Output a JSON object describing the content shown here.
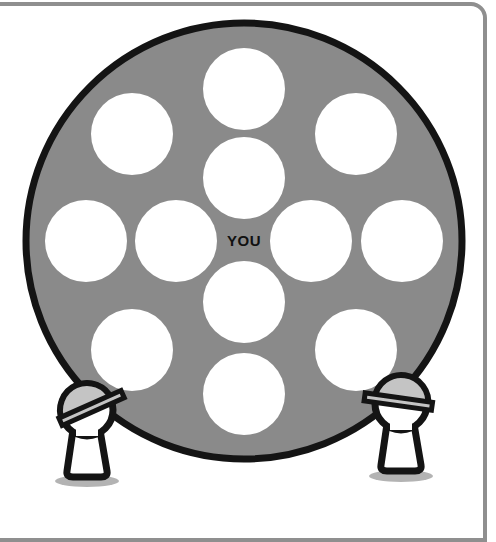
{
  "diagram": {
    "title": "",
    "center_label": "YOU",
    "colors": {
      "background": "#ffffff",
      "frame": "#8f8f8f",
      "disc_fill": "#8a8a8a",
      "disc_border": "#141414",
      "seat_fill": "#ffffff",
      "helmet_fill": "#c4c4c4",
      "figure_outline": "#141414",
      "shadow": "#b3b3b3"
    },
    "disc": {
      "cx": 244,
      "cy": 241,
      "r": 218,
      "border": 7
    },
    "seats": [
      {
        "id": "top",
        "cx": 244,
        "cy": 89,
        "r": 41
      },
      {
        "id": "upper-left",
        "cx": 132,
        "cy": 134,
        "r": 41
      },
      {
        "id": "upper-right",
        "cx": 356,
        "cy": 134,
        "r": 41
      },
      {
        "id": "inner-top",
        "cx": 244,
        "cy": 178,
        "r": 41
      },
      {
        "id": "far-left",
        "cx": 86,
        "cy": 241,
        "r": 41
      },
      {
        "id": "inner-left",
        "cx": 176,
        "cy": 241,
        "r": 41
      },
      {
        "id": "inner-right",
        "cx": 311,
        "cy": 241,
        "r": 41
      },
      {
        "id": "far-right",
        "cx": 402,
        "cy": 241,
        "r": 41
      },
      {
        "id": "inner-bottom",
        "cx": 244,
        "cy": 302,
        "r": 41
      },
      {
        "id": "lower-left",
        "cx": 132,
        "cy": 350,
        "r": 41
      },
      {
        "id": "lower-right",
        "cx": 356,
        "cy": 350,
        "r": 41
      },
      {
        "id": "bottom",
        "cx": 244,
        "cy": 394,
        "r": 41
      }
    ],
    "figures": [
      {
        "id": "left-worker",
        "side": "left",
        "icon": "hard-hat-worker-icon"
      },
      {
        "id": "right-worker",
        "side": "right",
        "icon": "hard-hat-worker-icon"
      }
    ]
  }
}
